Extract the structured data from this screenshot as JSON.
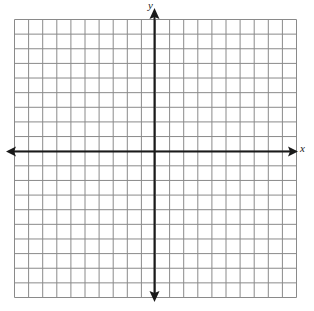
{
  "diagram": {
    "type": "coordinate-plane",
    "axes": {
      "x_label": "x",
      "y_label": "y"
    },
    "grid": {
      "columns": 20,
      "rows_above_x_axis": 9,
      "rows_below_x_axis": 10,
      "columns_left_of_y_axis": 10,
      "columns_right_of_y_axis": 10
    },
    "colors": {
      "grid_line": "#8a8a8a",
      "axis": "#1a1a1a",
      "background": "#ffffff"
    }
  }
}
